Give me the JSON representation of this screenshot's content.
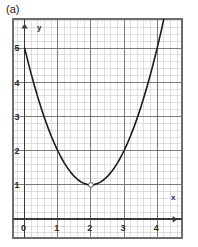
{
  "figure": {
    "panel_label": "(a)",
    "background_color": "#ffffff"
  },
  "chart_data": {
    "type": "line",
    "title": "",
    "subtitle": "",
    "xlabel": "x",
    "ylabel": "y",
    "xlim": [
      -0.35,
      4.75
    ],
    "ylim": [
      -0.55,
      5.85
    ],
    "xticks": [
      0,
      1,
      2,
      3,
      4
    ],
    "xtick_labels": [
      "0",
      "1",
      "2",
      "3",
      "4"
    ],
    "yticks": [
      1,
      2,
      3,
      4,
      5
    ],
    "ytick_labels": [
      "1",
      "2",
      "3",
      "4",
      "5"
    ],
    "grid": true,
    "grid_major_color": "#6e6e6e",
    "grid_minor_color": "#c9c9c9",
    "minor_per_major": 5,
    "axis_color": "#3a3a3a",
    "axis_arrows": true,
    "legend": null,
    "series": [
      {
        "name": "y = (x - 2)^2 + 1",
        "equation": "y = (x-2)^2 + 1",
        "color": "#1a1a1a",
        "line_width": 1.6,
        "x": [
          0.0,
          0.1,
          0.2,
          0.3,
          0.4,
          0.5,
          0.6,
          0.7,
          0.8,
          0.9,
          1.0,
          1.1,
          1.2,
          1.3,
          1.4,
          1.5,
          1.6,
          1.7,
          1.8,
          1.9,
          2.0,
          2.1,
          2.2,
          2.3,
          2.4,
          2.5,
          2.6,
          2.7,
          2.8,
          2.9,
          3.0,
          3.1,
          3.2,
          3.3,
          3.4,
          3.5,
          3.6,
          3.7,
          3.8,
          3.9,
          4.0,
          4.1,
          4.2,
          4.3,
          4.4
        ],
        "y": [
          5.0,
          4.61,
          4.24,
          3.89,
          3.56,
          3.25,
          2.96,
          2.69,
          2.44,
          2.21,
          2.0,
          1.81,
          1.64,
          1.49,
          1.36,
          1.25,
          1.16,
          1.09,
          1.04,
          1.01,
          1.0,
          1.01,
          1.04,
          1.09,
          1.16,
          1.25,
          1.36,
          1.49,
          1.64,
          1.81,
          2.0,
          2.21,
          2.44,
          2.69,
          2.96,
          3.25,
          3.56,
          3.89,
          4.24,
          4.61,
          5.0,
          5.41,
          5.84,
          6.29,
          6.76
        ]
      }
    ],
    "markers": [
      {
        "name": "vertex",
        "x": 2,
        "y": 1,
        "shape": "circle",
        "filled": false,
        "radius": 2.4,
        "color": "#555555"
      }
    ],
    "annotations": []
  }
}
